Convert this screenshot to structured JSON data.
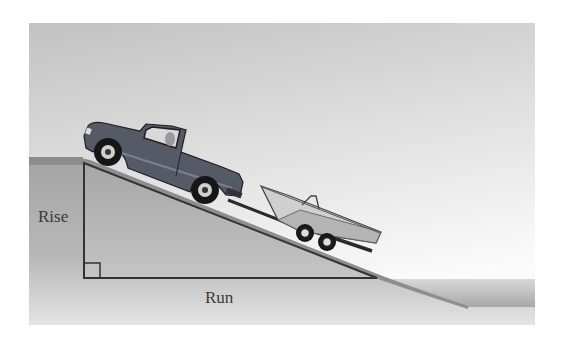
{
  "figure": {
    "labels": {
      "rise": "Rise",
      "run": "Run"
    },
    "colors": {
      "sky_top": "#c4c4c4",
      "sky_bottom": "#f4f4f4",
      "ground": "#a9a9a9",
      "ground_edge": "#8a8a8a",
      "water_top": "#cfcfcf",
      "water_bottom": "#9a9a9a",
      "line": "#3a3a3a",
      "truck": "#555a66",
      "boat": "#c8c8c8"
    }
  }
}
